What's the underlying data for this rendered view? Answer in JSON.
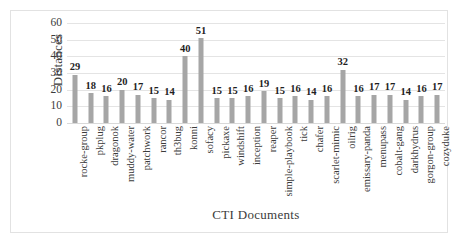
{
  "chart_data": {
    "type": "bar",
    "title": "",
    "xlabel": "CTI Documents",
    "ylabel": "Distances",
    "ylim": [
      0,
      60
    ],
    "yticks": [
      0,
      10,
      20,
      30,
      40,
      50,
      60
    ],
    "grid": true,
    "legend": "none",
    "bar_color": "#a6a6a6",
    "categories": [
      "rocke-group",
      "pkplug",
      "dragonok",
      "muddy-water",
      "patchwork",
      "rancor",
      "th3bug",
      "konni",
      "sofacy",
      "pickaxe",
      "windshift",
      "inception",
      "reaper",
      "simple-playbook",
      "tick",
      "chafer",
      "scarlet-mimic",
      "oilrig",
      "emissary-panda",
      "menupass",
      "cobalt-gang",
      "darkhydrus",
      "gorgon-group",
      "cozyduke"
    ],
    "values": [
      29,
      18,
      16,
      20,
      17,
      15,
      14,
      40,
      51,
      15,
      15,
      16,
      19,
      15,
      16,
      14,
      16,
      32,
      16,
      17,
      17,
      14,
      16,
      17
    ]
  }
}
